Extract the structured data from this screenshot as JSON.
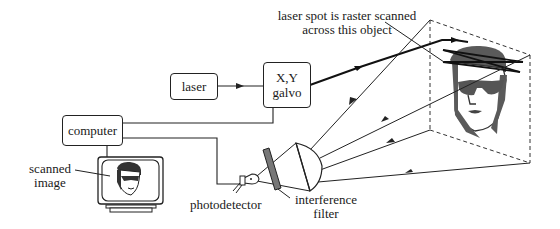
{
  "diagram": {
    "components": {
      "laser": {
        "label": "laser"
      },
      "galvo": {
        "label_line1": "X,Y",
        "label_line2": "galvo"
      },
      "computer": {
        "label": "computer"
      },
      "monitor": {
        "label_line1": "scanned",
        "label_line2": "image"
      },
      "photodetector": {
        "label": "photodetector"
      },
      "filter": {
        "label_line1": "interference",
        "label_line2": "filter"
      },
      "object": {
        "label_line1": "laser spot is raster scanned",
        "label_line2": "across this object"
      }
    },
    "connections": [
      {
        "from": "laser",
        "to": "galvo",
        "type": "arrow"
      },
      {
        "from": "galvo",
        "to": "object",
        "type": "laser-beam"
      },
      {
        "from": "computer",
        "to": "galvo",
        "type": "wire"
      },
      {
        "from": "computer",
        "to": "photodetector",
        "type": "wire"
      },
      {
        "from": "computer",
        "to": "monitor",
        "type": "wire"
      },
      {
        "from": "object",
        "to": "lens",
        "type": "scattered-light-rays"
      },
      {
        "from": "lens",
        "to": "filter",
        "type": "light"
      },
      {
        "from": "filter",
        "to": "photodetector",
        "type": "light"
      }
    ],
    "colors": {
      "line": "#222222",
      "filter": "#777777",
      "face": "#5a5a5a",
      "beam": "#111111"
    }
  }
}
